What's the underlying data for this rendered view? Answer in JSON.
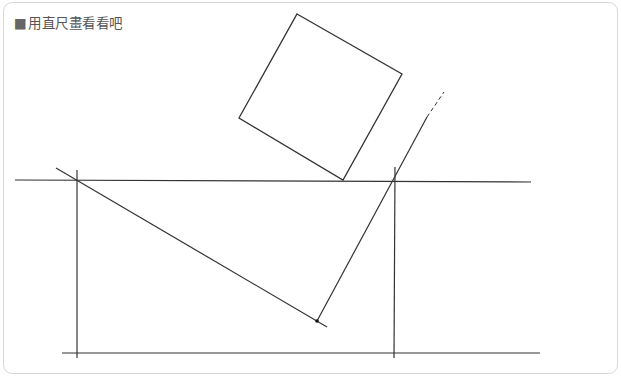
{
  "panel": {
    "title_marker": "■",
    "title": "用直尺畫看看吧"
  },
  "drawing": {
    "stroke_color": "#333333",
    "lines": [
      {
        "id": "top-horizontal",
        "x1": 15,
        "y1": 180,
        "x2": 531,
        "y2": 182
      },
      {
        "id": "bottom-horizontal",
        "x1": 62,
        "y1": 353,
        "x2": 540,
        "y2": 353
      },
      {
        "id": "left-vertical",
        "x1": 77,
        "y1": 170,
        "x2": 77,
        "y2": 358
      },
      {
        "id": "right-vertical",
        "x1": 395,
        "y1": 167,
        "x2": 394,
        "y2": 358
      },
      {
        "id": "long-diagonal",
        "x1": 56,
        "y1": 168,
        "x2": 327,
        "y2": 327
      },
      {
        "id": "steep-diagonal",
        "x1": 317,
        "y1": 321,
        "x2": 427,
        "y2": 117
      }
    ],
    "dashed_lines": [
      {
        "id": "steep-diagonal-extension",
        "x1": 427,
        "y1": 117,
        "x2": 444,
        "y2": 92
      }
    ],
    "square": {
      "points": "297,14 402,74 343,180 239,118"
    },
    "point": {
      "cx": 317,
      "cy": 321,
      "r": 1.8
    }
  }
}
